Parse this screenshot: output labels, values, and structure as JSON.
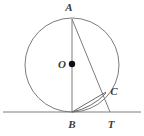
{
  "figure": {
    "kind": "geometry-diagram",
    "canvas": {
      "width": 144,
      "height": 136,
      "background": "#ffffff"
    },
    "colors": {
      "stroke": "#7c7c7c",
      "stroke_dark": "#6b6b6b",
      "label": "#3b3b3b",
      "center_dot": "#111111",
      "background": "#ffffff"
    },
    "stroke_width": 1,
    "circle": {
      "cx": 72,
      "cy": 65,
      "r": 47
    },
    "center_dot": {
      "cx": 72,
      "cy": 64,
      "r": 3.2
    },
    "points": [
      {
        "name": "A",
        "label": "A",
        "x": 72,
        "y": 19,
        "label_x": 69,
        "label_y": 7
      },
      {
        "name": "O",
        "label": "O",
        "x": 72,
        "y": 64,
        "label_x": 62,
        "label_y": 64
      },
      {
        "name": "C",
        "label": "C",
        "x": 105,
        "y": 92,
        "label_x": 114,
        "label_y": 91
      },
      {
        "name": "B",
        "label": "B",
        "x": 72,
        "y": 112,
        "label_x": 72,
        "label_y": 124
      },
      {
        "name": "T",
        "label": "T",
        "x": 110,
        "y": 112,
        "label_x": 111,
        "label_y": 124
      }
    ],
    "segments": [
      {
        "name": "tangent-line-at-B",
        "x1": 3,
        "y1": 112,
        "x2": 141,
        "y2": 112
      },
      {
        "name": "diameter-A-to-B",
        "x1": 72,
        "y1": 19,
        "x2": 72,
        "y2": 112
      },
      {
        "name": "secant-A-to-T",
        "x1": 72,
        "y1": 19,
        "x2": 110,
        "y2": 112
      },
      {
        "name": "chord-B-to-C",
        "x1": 72,
        "y1": 112,
        "x2": 106,
        "y2": 92
      }
    ],
    "arcs": [
      {
        "name": "arc-B-to-C",
        "d": "M 72 112 Q 92 108 106 93"
      }
    ]
  }
}
